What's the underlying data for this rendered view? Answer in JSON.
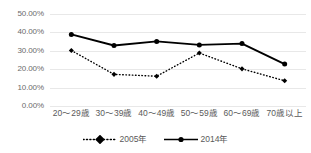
{
  "chart_data": {
    "type": "line",
    "title": "",
    "xlabel": "",
    "ylabel": "",
    "categories": [
      "20～29歳",
      "30～39歳",
      "40～49歳",
      "50～59歳",
      "60～69歳",
      "70歳以上"
    ],
    "series": [
      {
        "name": "2005年",
        "values": [
          30.2,
          17.2,
          16.2,
          28.8,
          20.2,
          13.7
        ],
        "style": "dotted",
        "color": "#000000",
        "marker": "diamond"
      },
      {
        "name": "2014年",
        "values": [
          38.9,
          32.9,
          35.1,
          33.2,
          33.9,
          22.8
        ],
        "style": "solid",
        "color": "#000000",
        "marker": "circle"
      }
    ],
    "ylim": [
      0,
      50
    ],
    "yticks": [
      0,
      10,
      20,
      30,
      40,
      50
    ],
    "ytick_labels": [
      "0.00%",
      "10.00%",
      "20.00%",
      "30.00%",
      "40.00%",
      "50.00%"
    ],
    "grid": true,
    "grid_color": "#e8e8e8",
    "legend_position": "bottom"
  },
  "legend": {
    "entries": [
      {
        "label": "2005年"
      },
      {
        "label": "2014年"
      }
    ]
  }
}
